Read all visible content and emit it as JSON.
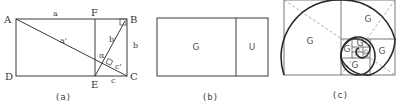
{
  "panels": [
    {
      "id": "a",
      "caption": "(a)",
      "points": {
        "A": "A",
        "B": "B",
        "C": "C",
        "D": "D",
        "E": "E",
        "F": "F"
      },
      "segment_labels": {
        "a": "a",
        "a_prime": "a'",
        "b": "b",
        "b_prime": "b'",
        "c": "c",
        "c_prime": "c'",
        "alpha": "α"
      }
    },
    {
      "id": "b",
      "caption": "(b)",
      "regions": [
        "G",
        "U"
      ]
    },
    {
      "id": "c",
      "caption": "(c)",
      "regions": [
        "G",
        "G",
        "G",
        "G",
        "G",
        "G",
        "G",
        "G"
      ]
    }
  ]
}
